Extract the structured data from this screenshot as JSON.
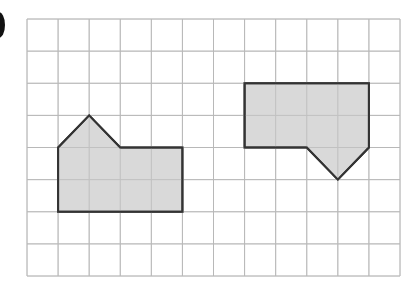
{
  "figure": {
    "grid": {
      "cols": 12,
      "rows": 8,
      "left": 27,
      "top": 19,
      "right": 400,
      "bottom": 276,
      "line_color": "#b8b8b8"
    },
    "shapes": [
      {
        "name": "left-house-shape",
        "fill": "#d2d2d2",
        "stroke": "#333333",
        "points": [
          [
            1,
            4
          ],
          [
            2,
            3
          ],
          [
            3,
            4
          ],
          [
            5,
            4
          ],
          [
            5,
            6
          ],
          [
            1,
            6
          ]
        ]
      },
      {
        "name": "right-inverted-house-shape",
        "fill": "#d2d2d2",
        "stroke": "#333333",
        "points": [
          [
            7,
            2
          ],
          [
            11,
            2
          ],
          [
            11,
            4
          ],
          [
            10,
            5
          ],
          [
            9,
            4
          ],
          [
            7,
            4
          ]
        ]
      }
    ]
  }
}
